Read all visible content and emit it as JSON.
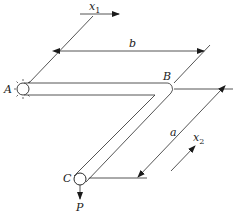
{
  "diagram": {
    "type": "mechanics-bent-bar",
    "points": {
      "A": {
        "label": "A",
        "description": "fixed support (wall)"
      },
      "B": {
        "label": "B",
        "description": "90-degree bend"
      },
      "C": {
        "label": "C",
        "description": "free end with load"
      }
    },
    "dimensions": {
      "b": {
        "label": "b",
        "description": "length of segment AB"
      },
      "a": {
        "label": "a",
        "description": "length of segment BC"
      }
    },
    "axes": {
      "x1": {
        "label": "x",
        "sub": "1"
      },
      "x2": {
        "label": "x",
        "sub": "2"
      }
    },
    "load": {
      "label": "P",
      "direction": "down"
    }
  }
}
